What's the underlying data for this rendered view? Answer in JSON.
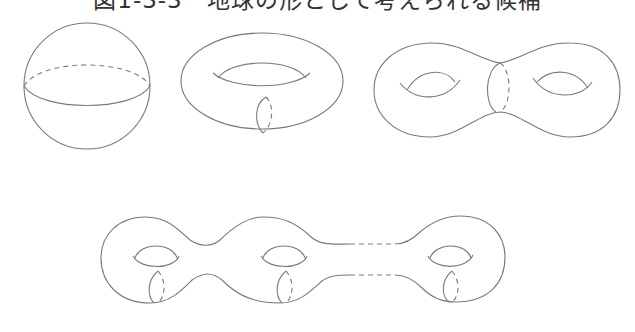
{
  "figure": {
    "title": "図1-3-3　地球の形として考えられる候補",
    "stroke_color": "#7a7a7a",
    "background": "#ffffff",
    "shapes": [
      {
        "name": "sphere",
        "genus": 0
      },
      {
        "name": "torus",
        "genus": 1
      },
      {
        "name": "double-torus",
        "genus": 2
      },
      {
        "name": "n-holed-torus",
        "genus": "n"
      }
    ]
  }
}
